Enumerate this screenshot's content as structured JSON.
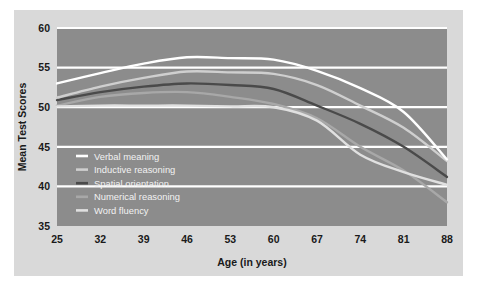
{
  "chart_data": {
    "type": "line",
    "title": "",
    "xlabel": "Age (in years)",
    "ylabel": "Mean Test Scores",
    "x": [
      25,
      32,
      39,
      46,
      53,
      60,
      67,
      74,
      81,
      88
    ],
    "categories": [
      "25",
      "32",
      "39",
      "46",
      "53",
      "60",
      "67",
      "74",
      "81",
      "88"
    ],
    "xlim": [
      25,
      88
    ],
    "ylim": [
      35,
      60
    ],
    "yticks": [
      35,
      40,
      45,
      50,
      55,
      60
    ],
    "xticks": [
      25,
      32,
      39,
      46,
      53,
      60,
      67,
      74,
      81,
      88
    ],
    "grid": "horizontal",
    "legend_position": "inside-lower-left",
    "plot_background": "#8c8c8c",
    "panel_background": "#d9d9d9",
    "gridline_color": "#ffffff",
    "series": [
      {
        "name": "Verbal meaning",
        "color": "#ffffff",
        "values": [
          53.0,
          54.3,
          55.5,
          56.3,
          56.2,
          56.0,
          54.6,
          52.4,
          49.4,
          43.4
        ]
      },
      {
        "name": "Inductive reasoning",
        "color": "#cfcfcf",
        "values": [
          51.2,
          52.6,
          53.7,
          54.5,
          54.4,
          54.2,
          52.8,
          50.2,
          47.4,
          43.2
        ]
      },
      {
        "name": "Spatial orientation",
        "color": "#4a4a4a",
        "values": [
          50.9,
          51.9,
          52.6,
          53.0,
          52.8,
          52.3,
          50.2,
          47.9,
          45.0,
          41.2
        ]
      },
      {
        "name": "Numerical reasoning",
        "color": "#a8a8a8",
        "values": [
          50.2,
          51.3,
          51.8,
          51.9,
          51.3,
          50.4,
          48.6,
          45.0,
          42.0,
          38.0
        ]
      },
      {
        "name": "Word fluency",
        "color": "#e0e0e0",
        "values": [
          50.1,
          50.2,
          50.2,
          50.2,
          50.1,
          50.0,
          48.3,
          44.0,
          41.8,
          40.2
        ]
      }
    ]
  },
  "axes": {
    "y_tick_labels": [
      "60",
      "55",
      "50",
      "45",
      "40",
      "35"
    ],
    "x_tick_labels": [
      "25",
      "32",
      "39",
      "46",
      "53",
      "60",
      "67",
      "74",
      "81",
      "88"
    ],
    "y_axis_title": "Mean Test Scores",
    "x_axis_title": "Age (in years)"
  },
  "legend": {
    "items": [
      {
        "label": "Verbal meaning",
        "color": "#ffffff"
      },
      {
        "label": "Inductive reasoning",
        "color": "#cfcfcf"
      },
      {
        "label": "Spatial orientation",
        "color": "#4a4a4a"
      },
      {
        "label": "Numerical reasoning",
        "color": "#a8a8a8"
      },
      {
        "label": "Word fluency",
        "color": "#e0e0e0"
      }
    ]
  }
}
